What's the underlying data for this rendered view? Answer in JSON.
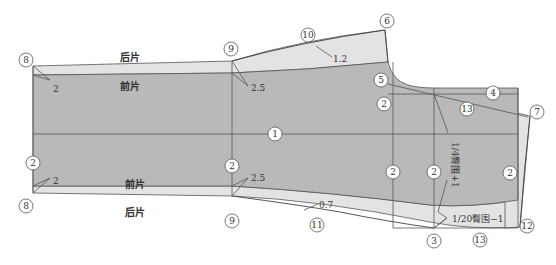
{
  "diagram": {
    "type": "garment-pattern-draft",
    "colors": {
      "front_piece_fill": "#b9b9b9",
      "back_piece_fill": "#e3e3e3",
      "line": "#555555",
      "background": "#ffffff"
    },
    "labels": {
      "back_top": "后片",
      "front_top": "前片",
      "front_bottom": "前片",
      "back_bottom": "后片",
      "formula_vertical": "1/4臀围+1",
      "formula_bottom": "1/20臀围−1"
    },
    "dimensions": {
      "left_top": "2",
      "left_bottom": "2",
      "knee_top": "2.5",
      "knee_bottom": "2.5",
      "back_top_curve": "1.2",
      "back_bottom_curve": "0.7"
    },
    "markers": [
      {
        "id": "m8-top",
        "label": "8"
      },
      {
        "id": "m9-top",
        "label": "9"
      },
      {
        "id": "m10",
        "label": "10"
      },
      {
        "id": "m6",
        "label": "6"
      },
      {
        "id": "m5",
        "label": "5"
      },
      {
        "id": "m4",
        "label": "4"
      },
      {
        "id": "m7",
        "label": "7"
      },
      {
        "id": "m2-a",
        "label": "2"
      },
      {
        "id": "m13-top",
        "label": "13"
      },
      {
        "id": "m1",
        "label": "1"
      },
      {
        "id": "m2-left",
        "label": "2"
      },
      {
        "id": "m2-knee",
        "label": "2"
      },
      {
        "id": "m2-crotch",
        "label": "2"
      },
      {
        "id": "m2-hip",
        "label": "2"
      },
      {
        "id": "m2-right",
        "label": "2"
      },
      {
        "id": "m8-bottom",
        "label": "8"
      },
      {
        "id": "m9-bottom",
        "label": "9"
      },
      {
        "id": "m11",
        "label": "11"
      },
      {
        "id": "m3",
        "label": "3"
      },
      {
        "id": "m13-bottom",
        "label": "13"
      },
      {
        "id": "m12",
        "label": "12"
      }
    ]
  }
}
